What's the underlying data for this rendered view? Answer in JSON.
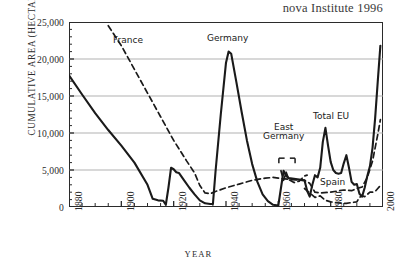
{
  "source_note": "nova Institute 1996",
  "axes": {
    "y_title": "CUMULATIVE AREA (HECTARES)",
    "x_title": "YEAR",
    "y_ticks": [
      "25,000",
      "20,000",
      "15,000",
      "10,000",
      "5,000",
      "0"
    ],
    "x_ticks": [
      "1880",
      "1900",
      "1920",
      "1940",
      "1960",
      "1980",
      "2000"
    ]
  },
  "annotations": {
    "france": "France",
    "germany": "Germany",
    "east_germany_line1": "East",
    "east_germany_line2": "Germany",
    "total_eu": "Total EU",
    "spain": "Spain"
  },
  "colors": {
    "line": "#1a1a1a",
    "grid": "#a8a8a8",
    "frame": "#2b2b2b",
    "text": "#2b2b2b"
  },
  "chart_data": {
    "type": "line",
    "title": "",
    "subtitle": "",
    "source": "nova Institute 1996",
    "xlabel": "YEAR",
    "ylabel": "CUMULATIVE AREA (HECTARES)",
    "xlim": [
      1880,
      2000
    ],
    "ylim": [
      0,
      25000
    ],
    "y_ticks": [
      0,
      5000,
      10000,
      15000,
      20000,
      25000
    ],
    "x_ticks": [
      1880,
      1900,
      1920,
      1940,
      1960,
      1980,
      2000
    ],
    "x_minor_tick_interval": 5,
    "grid": "horizontal",
    "legend": "inline-annotations",
    "series": [
      {
        "name": "Total EU",
        "style": "solid",
        "width": "thick",
        "label_position": {
          "x": 1977,
          "y": 12200
        },
        "points": [
          [
            1880,
            17800
          ],
          [
            1885,
            15200
          ],
          [
            1890,
            12700
          ],
          [
            1895,
            10400
          ],
          [
            1900,
            8300
          ],
          [
            1905,
            6000
          ],
          [
            1910,
            3000
          ],
          [
            1912,
            1100
          ],
          [
            1914,
            900
          ],
          [
            1916,
            850
          ],
          [
            1917,
            300
          ],
          [
            1918,
            2600
          ],
          [
            1919,
            5300
          ],
          [
            1920,
            5100
          ],
          [
            1921,
            4700
          ],
          [
            1922,
            4600
          ],
          [
            1924,
            3600
          ],
          [
            1926,
            2600
          ],
          [
            1928,
            1700
          ],
          [
            1930,
            900
          ],
          [
            1932,
            500
          ],
          [
            1934,
            400
          ],
          [
            1935,
            400
          ],
          [
            1936,
            4800
          ],
          [
            1938,
            12500
          ],
          [
            1940,
            19500
          ],
          [
            1941,
            21000
          ],
          [
            1942,
            20700
          ],
          [
            1944,
            16800
          ],
          [
            1946,
            12800
          ],
          [
            1948,
            9000
          ],
          [
            1950,
            5800
          ],
          [
            1952,
            3400
          ],
          [
            1954,
            1700
          ],
          [
            1956,
            800
          ],
          [
            1958,
            300
          ],
          [
            1960,
            200
          ],
          [
            1962,
            4900
          ],
          [
            1963,
            4200
          ],
          [
            1964,
            3900
          ],
          [
            1966,
            3800
          ],
          [
            1968,
            3700
          ],
          [
            1970,
            3600
          ],
          [
            1971,
            2200
          ],
          [
            1972,
            1400
          ],
          [
            1973,
            3000
          ],
          [
            1974,
            4300
          ],
          [
            1975,
            4000
          ],
          [
            1976,
            5300
          ],
          [
            1977,
            8800
          ],
          [
            1978,
            10700
          ],
          [
            1979,
            8300
          ],
          [
            1980,
            6100
          ],
          [
            1981,
            5000
          ],
          [
            1982,
            4600
          ],
          [
            1983,
            4500
          ],
          [
            1984,
            4600
          ],
          [
            1985,
            5900
          ],
          [
            1986,
            7000
          ],
          [
            1987,
            5300
          ],
          [
            1988,
            3400
          ],
          [
            1989,
            3000
          ],
          [
            1990,
            3100
          ],
          [
            1991,
            1800
          ],
          [
            1992,
            1400
          ],
          [
            1993,
            2600
          ],
          [
            1994,
            4200
          ],
          [
            1995,
            5500
          ],
          [
            1996,
            8000
          ],
          [
            1997,
            12000
          ],
          [
            1998,
            17000
          ],
          [
            1999,
            21800
          ]
        ]
      },
      {
        "name": "France",
        "style": "dashed",
        "width": "medium",
        "label_position": {
          "x": 1901,
          "y": 22600
        },
        "points": [
          [
            1895,
            24500
          ],
          [
            1900,
            21800
          ],
          [
            1905,
            18600
          ],
          [
            1910,
            15400
          ],
          [
            1915,
            12200
          ],
          [
            1920,
            9000
          ],
          [
            1925,
            6200
          ],
          [
            1928,
            4600
          ],
          [
            1930,
            2900
          ],
          [
            1932,
            1900
          ],
          [
            1934,
            1800
          ],
          [
            1936,
            2100
          ],
          [
            1940,
            2600
          ],
          [
            1945,
            3100
          ],
          [
            1950,
            3600
          ],
          [
            1955,
            3900
          ],
          [
            1958,
            4000
          ],
          [
            1960,
            3900
          ],
          [
            1965,
            3700
          ],
          [
            1970,
            3600
          ],
          [
            1972,
            3200
          ],
          [
            1974,
            2000
          ],
          [
            1976,
            1900
          ],
          [
            1980,
            2000
          ],
          [
            1985,
            2300
          ],
          [
            1988,
            2200
          ],
          [
            1990,
            2500
          ],
          [
            1992,
            2700
          ],
          [
            1994,
            4000
          ],
          [
            1996,
            6200
          ],
          [
            1998,
            9800
          ],
          [
            1999,
            11800
          ]
        ]
      },
      {
        "name": "East Germany",
        "style": "dashed",
        "width": "medium",
        "label_position": {
          "x": 1963,
          "y": 8200
        },
        "points": [
          [
            1961,
            4900
          ],
          [
            1962,
            3600
          ],
          [
            1963,
            4700
          ],
          [
            1964,
            3700
          ],
          [
            1966,
            3300
          ],
          [
            1968,
            3500
          ],
          [
            1970,
            4200
          ],
          [
            1971,
            4300
          ]
        ]
      },
      {
        "name": "Spain",
        "style": "dashed",
        "width": "medium",
        "label_position": {
          "x": 1983,
          "y": 2100
        },
        "points": [
          [
            1970,
            2500
          ],
          [
            1972,
            1900
          ],
          [
            1974,
            1300
          ],
          [
            1976,
            1500
          ],
          [
            1978,
            900
          ],
          [
            1980,
            700
          ],
          [
            1982,
            600
          ],
          [
            1984,
            500
          ],
          [
            1986,
            500
          ],
          [
            1988,
            600
          ],
          [
            1990,
            700
          ],
          [
            1991,
            1300
          ],
          [
            1992,
            1500
          ],
          [
            1993,
            1400
          ],
          [
            1994,
            1700
          ],
          [
            1995,
            2000
          ],
          [
            1996,
            2000
          ],
          [
            1997,
            2100
          ],
          [
            1998,
            2500
          ],
          [
            1999,
            2900
          ]
        ]
      }
    ],
    "annotations": [
      {
        "text": "France",
        "x": 1901,
        "y": 22600
      },
      {
        "text": "Germany",
        "x": 1939,
        "y": 23100
      },
      {
        "text": "East Germany",
        "x": 1962,
        "y": 8400
      },
      {
        "text": "Total EU",
        "x": 1977,
        "y": 12200
      },
      {
        "text": "Spain",
        "x": 1983,
        "y": 2100
      }
    ]
  }
}
